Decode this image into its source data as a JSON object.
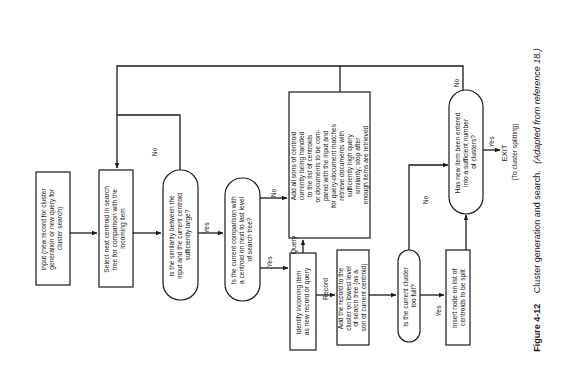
{
  "figure": {
    "number_label": "Figure 4-12",
    "caption": "Cluster generation and search.",
    "caption_note": "(Adapted from reference 18.)"
  },
  "nodes": {
    "input": {
      "type": "process",
      "lines": [
        "Input (new record for cluster",
        "generation or new query for",
        "cluster search)"
      ]
    },
    "select": {
      "type": "process",
      "lines": [
        "Select next centroid in search",
        "tree for comparison with the",
        "incoming item"
      ]
    },
    "similarity": {
      "type": "decision",
      "lines": [
        "Is the similarity between the",
        "input and the current centroid",
        "sufficiently large?"
      ]
    },
    "last_level": {
      "type": "decision",
      "lines": [
        "Is the current comparison with",
        "a centroid on next to last level",
        "of search tree?"
      ]
    },
    "add_sons": {
      "type": "process",
      "lines": [
        "Add all sons of centroid",
        "currently being handled",
        "to the list of centroids",
        "or documents to be com-",
        "pared with the input and",
        "for query-document matches",
        "retrieve documents with",
        "sufficiently high query",
        "similarity; stop after",
        "enough items are retrieved"
      ]
    },
    "identify": {
      "type": "process",
      "lines": [
        "Identify incoming item",
        "as new record or query"
      ]
    },
    "add_record": {
      "type": "process",
      "lines": [
        "Add the record to the",
        "cluster on lowest level",
        "of search tree (as a",
        "son of current centroid)"
      ]
    },
    "too_full": {
      "type": "decision",
      "lines": [
        "Is the current cluster",
        "too full?"
      ]
    },
    "insert_node": {
      "type": "process",
      "lines": [
        "Insert node on list of",
        "centroids to be split"
      ]
    },
    "sufficient": {
      "type": "decision",
      "lines": [
        "Has new item been entered",
        "into a sufficient number",
        "of clusters?"
      ]
    },
    "exit": {
      "type": "terminal",
      "lines": [
        "EXIT",
        "(To cluster splitting)"
      ]
    }
  },
  "edge_labels": {
    "similarity_no": "No",
    "similarity_yes": "Yes",
    "last_level_no": "No",
    "last_level_yes": "Yes",
    "identify_query": "Query",
    "identify_record": "Record",
    "too_full_no": "No",
    "too_full_yes": "Yes",
    "sufficient_no": "No",
    "sufficient_yes": "Yes"
  },
  "colors": {
    "ink": "#1a1a1a",
    "paper": "#ffffff"
  }
}
